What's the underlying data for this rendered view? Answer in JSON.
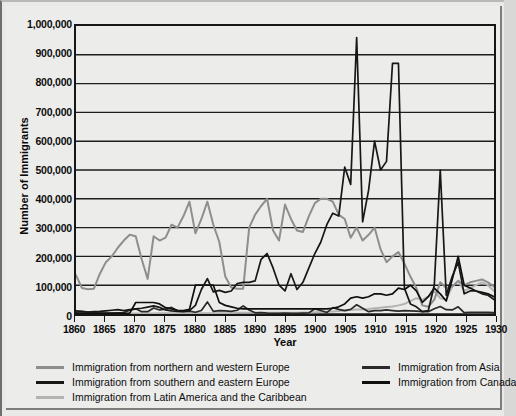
{
  "chart_data": {
    "type": "line",
    "title": "",
    "xlabel": "Year",
    "ylabel": "Number of Immigrants",
    "xlim": [
      1860,
      1930
    ],
    "ylim": [
      0,
      1000000
    ],
    "grid": true,
    "legend_position": "bottom",
    "ytick_labels": [
      "1,000,000",
      "900,000",
      "800,000",
      "700,000",
      "600,000",
      "500,000",
      "400,000",
      "300,000",
      "200,000",
      "100,000",
      "0"
    ],
    "ytick_values": [
      1000000,
      900000,
      800000,
      700000,
      600000,
      500000,
      400000,
      300000,
      200000,
      100000,
      0
    ],
    "xtick_labels": [
      "1860",
      "1865",
      "1870",
      "1875",
      "1880",
      "1885",
      "1890",
      "1895",
      "1900",
      "1905",
      "1910",
      "1915",
      "1920",
      "1925",
      "1930"
    ],
    "xtick_values": [
      1860,
      1865,
      1870,
      1875,
      1880,
      1885,
      1890,
      1895,
      1900,
      1905,
      1910,
      1915,
      1920,
      1925,
      1930
    ],
    "x": [
      1860,
      1861,
      1862,
      1863,
      1864,
      1865,
      1866,
      1867,
      1868,
      1869,
      1870,
      1871,
      1872,
      1873,
      1874,
      1875,
      1876,
      1877,
      1878,
      1879,
      1880,
      1881,
      1882,
      1883,
      1884,
      1885,
      1886,
      1887,
      1888,
      1889,
      1890,
      1891,
      1892,
      1893,
      1894,
      1895,
      1896,
      1897,
      1898,
      1899,
      1900,
      1901,
      1902,
      1903,
      1904,
      1905,
      1906,
      1907,
      1908,
      1909,
      1910,
      1911,
      1912,
      1913,
      1914,
      1915,
      1916,
      1917,
      1918,
      1919,
      1920,
      1921,
      1922,
      1923,
      1924,
      1925,
      1926,
      1927,
      1928,
      1929,
      1930
    ],
    "series": [
      {
        "name": "Immigration from northern and western Europe",
        "color": "#8e8e8e",
        "values": [
          135000,
          90000,
          86000,
          88000,
          140000,
          180000,
          200000,
          230000,
          255000,
          275000,
          270000,
          190000,
          122000,
          270000,
          255000,
          265000,
          310000,
          300000,
          340000,
          390000,
          280000,
          330000,
          390000,
          310000,
          250000,
          130000,
          92000,
          88000,
          88000,
          300000,
          345000,
          375000,
          400000,
          290000,
          255000,
          380000,
          330000,
          290000,
          285000,
          340000,
          385000,
          400000,
          400000,
          390000,
          345000,
          330000,
          265000,
          300000,
          255000,
          275000,
          300000,
          225000,
          180000,
          200000,
          215000,
          175000,
          130000,
          90000,
          30000,
          25000,
          50000,
          110000,
          90000,
          95000,
          115000,
          100000,
          110000,
          115000,
          120000,
          110000,
          95000
        ]
      },
      {
        "name": "Immigration from southern and eastern Europe",
        "color": "#171717",
        "values": [
          11000,
          9000,
          7000,
          8000,
          9000,
          11000,
          13000,
          15000,
          12000,
          15000,
          18000,
          20000,
          24000,
          28000,
          23000,
          14000,
          11000,
          9000,
          8000,
          12000,
          30000,
          85000,
          123000,
          77000,
          82000,
          75000,
          80000,
          106000,
          110000,
          110000,
          115000,
          190000,
          210000,
          160000,
          100000,
          80000,
          140000,
          85000,
          110000,
          160000,
          210000,
          250000,
          310000,
          350000,
          340000,
          510000,
          450000,
          960000,
          320000,
          430000,
          600000,
          500000,
          530000,
          870000,
          870000,
          90000,
          35000,
          25000,
          8000,
          12000,
          100000,
          500000,
          65000,
          130000,
          180000,
          70000,
          80000,
          80000,
          70000,
          65000,
          50000
        ]
      },
      {
        "name": "Immigration from Latin America and the Caribbean",
        "color": "#b3b3b3",
        "values": [
          2000,
          2000,
          2000,
          2000,
          2000,
          2000,
          2000,
          2000,
          2000,
          2000,
          2000,
          2000,
          2000,
          2000,
          3000,
          3000,
          3000,
          3000,
          3000,
          3000,
          3000,
          3000,
          3000,
          3000,
          3000,
          3000,
          3000,
          4000,
          4000,
          4000,
          4000,
          4000,
          4000,
          4000,
          4000,
          4000,
          4000,
          4000,
          5000,
          5000,
          6000,
          7000,
          8000,
          9000,
          10000,
          12000,
          14000,
          16000,
          16000,
          17000,
          20000,
          22000,
          24000,
          26000,
          30000,
          35000,
          45000,
          55000,
          50000,
          60000,
          80000,
          55000,
          50000,
          95000,
          115000,
          80000,
          90000,
          100000,
          110000,
          100000,
          80000
        ]
      },
      {
        "name": "Immigration from Asia",
        "color": "#2a2a2a",
        "values": [
          6000,
          8000,
          6000,
          7000,
          3000,
          3000,
          3000,
          4000,
          5000,
          13000,
          18000,
          8000,
          8000,
          21000,
          14000,
          17000,
          23000,
          11000,
          9000,
          10000,
          6000,
          12000,
          42000,
          9000,
          12000,
          11000,
          9000,
          13000,
          28000,
          14000,
          4000,
          5000,
          3000,
          2000,
          2000,
          3000,
          2000,
          2000,
          3000,
          4000,
          18000,
          12000,
          5000,
          22000,
          16000,
          12000,
          16000,
          32000,
          20000,
          8000,
          12000,
          12000,
          14000,
          12000,
          10000,
          12000,
          11000,
          10000,
          8000,
          8000,
          18000,
          26000,
          15000,
          14000,
          25000,
          5000,
          6000,
          6000,
          6000,
          6000,
          5000
        ]
      },
      {
        "name": "Immigration from Canada",
        "color": "#0f0f0f",
        "values": [
          2000,
          2000,
          2000,
          2000,
          2000,
          2000,
          2000,
          2000,
          2000,
          3000,
          40000,
          40000,
          40000,
          40000,
          35000,
          22000,
          18000,
          13000,
          12000,
          16000,
          100000,
          100000,
          100000,
          100000,
          40000,
          30000,
          25000,
          20000,
          18000,
          18000,
          18000,
          18000,
          18000,
          18000,
          18000,
          18000,
          18000,
          18000,
          18000,
          18000,
          18000,
          18000,
          18000,
          20000,
          25000,
          35000,
          55000,
          60000,
          55000,
          60000,
          70000,
          70000,
          65000,
          70000,
          90000,
          85000,
          100000,
          80000,
          40000,
          60000,
          90000,
          70000,
          45000,
          120000,
          200000,
          100000,
          90000,
          80000,
          75000,
          70000,
          60000
        ]
      }
    ]
  },
  "legend": {
    "left_items": [
      {
        "label": "Immigration from northern and western Europe",
        "color": "#8e8e8e",
        "swatch": "line-swatch"
      },
      {
        "label": "Immigration from southern and eastern Europe",
        "color": "#171717",
        "swatch": "line-swatch"
      },
      {
        "label": "Immigration from Latin America and the Caribbean",
        "color": "#b3b3b3",
        "swatch": "line-swatch"
      }
    ],
    "right_items": [
      {
        "label": "Immigration from Asia",
        "color": "#2a2a2a",
        "swatch": "line-swatch"
      },
      {
        "label": "Immigration from Canada",
        "color": "#0f0f0f",
        "swatch": "line-swatch"
      }
    ]
  },
  "axes": {
    "x_title": "Year",
    "y_title": "Number of Immigrants"
  }
}
